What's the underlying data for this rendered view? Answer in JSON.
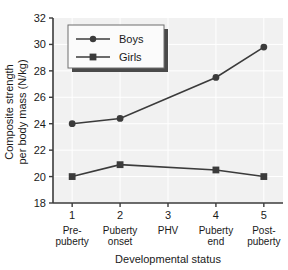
{
  "chart_data": {
    "type": "line",
    "title": "",
    "xlabel": "Developmental status",
    "ylabel_line1": "Composite strength",
    "ylabel_line2": "per body mass (N/kg)",
    "x": [
      1,
      2,
      3,
      4,
      5
    ],
    "categories": [
      "1",
      "2",
      "3",
      "4",
      "5"
    ],
    "category_names": [
      [
        "Pre-",
        "puberty"
      ],
      [
        "Puberty",
        "onset"
      ],
      [
        "PHV",
        ""
      ],
      [
        "Puberty",
        "end"
      ],
      [
        "Post-",
        "puberty"
      ]
    ],
    "xlim": [
      0.6,
      5.4
    ],
    "ylim": [
      18,
      32
    ],
    "yticks": [
      18,
      20,
      22,
      24,
      26,
      28,
      30,
      32
    ],
    "ytick_labels": [
      "18",
      "20",
      "22",
      "24",
      "26",
      "28",
      "30",
      "32"
    ],
    "grid": true,
    "legend_position": "upper-left",
    "series": [
      {
        "name": "Boys",
        "marker": "circle",
        "color": "#3b3b3b",
        "x": [
          1,
          2,
          4,
          5
        ],
        "values": [
          24.0,
          24.4,
          27.5,
          29.8
        ]
      },
      {
        "name": "Girls",
        "marker": "square",
        "color": "#3b3b3b",
        "x": [
          1,
          2,
          4,
          5
        ],
        "values": [
          20.0,
          20.9,
          20.5,
          20.0
        ]
      }
    ]
  },
  "legend": {
    "items": [
      {
        "label": "Boys",
        "marker": "circle"
      },
      {
        "label": "Girls",
        "marker": "square"
      }
    ]
  },
  "colors": {
    "plot_background": "#f1f1f1",
    "gridline": "#ffffff",
    "axis": "#3b3b3b",
    "series": "#3b3b3b",
    "text": "#1a1a1a",
    "legend_background": "#fbfbfb",
    "legend_shadow": "#4a4a4a"
  }
}
